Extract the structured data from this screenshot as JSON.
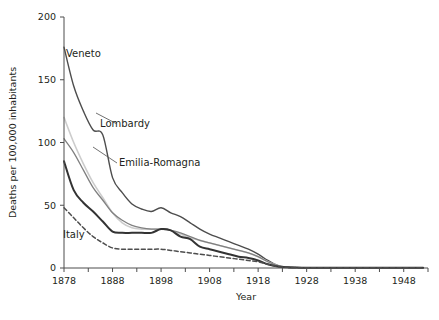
{
  "chart_data": {
    "type": "line",
    "title": "",
    "xlabel": "Year",
    "ylabel": "Deaths per 100,000 inhabitants",
    "xlim": [
      1878,
      1953
    ],
    "ylim": [
      0,
      200
    ],
    "yticks": [
      0,
      50,
      100,
      150,
      200
    ],
    "ytick_labels": [
      "0",
      "50",
      "100",
      "150",
      "200"
    ],
    "xticks": [
      1878,
      1883,
      1888,
      1893,
      1898,
      1903,
      1908,
      1913,
      1918,
      1923,
      1928,
      1933,
      1938,
      1943,
      1948,
      1953
    ],
    "xtick_labels": [
      "1878",
      "",
      "1888",
      "",
      "1898",
      "",
      "1908",
      "",
      "1918",
      "",
      "1928",
      "",
      "1938",
      "",
      "1948",
      ""
    ],
    "grid": false,
    "legend_position": "inline-annotations",
    "x": [
      1878,
      1880,
      1882,
      1884,
      1886,
      1888,
      1890,
      1892,
      1894,
      1896,
      1898,
      1900,
      1902,
      1904,
      1906,
      1908,
      1910,
      1912,
      1914,
      1916,
      1918,
      1920,
      1922,
      1924,
      1926,
      1928,
      1930,
      1932,
      1934,
      1936,
      1938,
      1940,
      1942,
      1944,
      1946,
      1948,
      1950,
      1952
    ],
    "series": [
      {
        "name": "Veneto",
        "color": "#4d4d4d",
        "style": "solid",
        "width": 1.4,
        "values": [
          176,
          145,
          125,
          110,
          106,
          72,
          60,
          51,
          47,
          45,
          48,
          44,
          41,
          36,
          31,
          27,
          24,
          21,
          18,
          15,
          11,
          6,
          2,
          0.6,
          0.3,
          0.2,
          0.2,
          0.2,
          0.2,
          0.2,
          0.2,
          0.2,
          0.2,
          0.2,
          0.2,
          0.2,
          0.2,
          0.2
        ]
      },
      {
        "name": "Lombardy",
        "color": "#cccccc",
        "style": "solid",
        "width": 1.6,
        "values": [
          120,
          100,
          83,
          68,
          56,
          44,
          36,
          32,
          31,
          31,
          31,
          30,
          27,
          24,
          22,
          20,
          18,
          16,
          14,
          12,
          9,
          5,
          2,
          0.6,
          0.3,
          0.2,
          0.2,
          0.2,
          0.2,
          0.2,
          0.2,
          0.2,
          0.2,
          0.2,
          0.2,
          0.2,
          0.2,
          0.2
        ]
      },
      {
        "name": "Emilia-Romagna",
        "color": "#808080",
        "style": "solid",
        "width": 1.3,
        "values": [
          103,
          92,
          78,
          64,
          54,
          44,
          38,
          34,
          32,
          31,
          31,
          30,
          28,
          25,
          22,
          20,
          18,
          16,
          14,
          12,
          9,
          5,
          2,
          0.6,
          0.3,
          0.2,
          0.2,
          0.2,
          0.2,
          0.2,
          0.2,
          0.2,
          0.2,
          0.2,
          0.2,
          0.2,
          0.2,
          0.2
        ]
      },
      {
        "name": "Italy",
        "color": "#333333",
        "style": "solid",
        "width": 2.0,
        "values": [
          85,
          62,
          52,
          45,
          37,
          29,
          28,
          28,
          28,
          28,
          31,
          30,
          25,
          23,
          17,
          15,
          13,
          11,
          9,
          8,
          6,
          3,
          1.2,
          0.5,
          0.3,
          0.2,
          0.2,
          0.2,
          0.2,
          0.2,
          0.2,
          0.2,
          0.2,
          0.2,
          0.2,
          0.2,
          0.2,
          0.2
        ]
      },
      {
        "name": "Italy-dashed",
        "color": "#4d4d4d",
        "style": "dashed",
        "width": 1.5,
        "values": [
          48,
          40,
          32,
          25,
          20,
          16,
          15,
          15,
          15,
          15,
          15,
          14,
          13,
          12,
          11,
          10,
          9,
          8,
          7,
          6,
          5,
          3,
          1.2,
          0.5,
          0.3,
          0.2,
          0.2,
          0.2,
          0.2,
          0.2,
          0.2,
          0.2,
          0.2,
          0.2,
          0.2,
          0.2,
          0.2,
          0.2
        ]
      }
    ],
    "annotations": [
      {
        "text": "Veneto",
        "x_px": 66,
        "y_px": 57
      },
      {
        "text": "Lombardy",
        "x_px": 100,
        "y_px": 127
      },
      {
        "text": "Emilia-Romagna",
        "x_px": 119,
        "y_px": 166
      },
      {
        "text": "Italy",
        "x_px": 63,
        "y_px": 238
      }
    ]
  }
}
